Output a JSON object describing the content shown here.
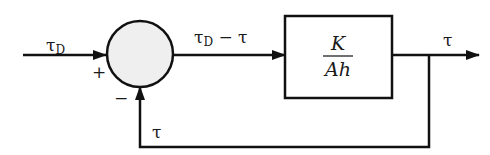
{
  "diagram": {
    "type": "block-diagram",
    "input": {
      "symbol": "τ",
      "subscript": "D"
    },
    "summing_junction": {
      "plus_sign": "+",
      "minus_sign": "−",
      "fill": "#efefef"
    },
    "error_signal": {
      "symbol": "τ",
      "subscript": "D",
      "operator": " − ",
      "symbol2": "τ"
    },
    "block": {
      "numerator": "K",
      "denominator": "Ah"
    },
    "output": {
      "symbol": "τ"
    },
    "feedback": {
      "symbol": "τ"
    }
  }
}
